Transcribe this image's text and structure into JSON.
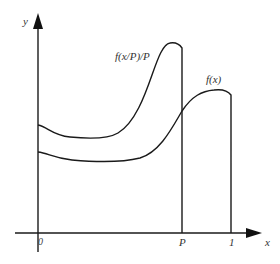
{
  "diagram": {
    "axes": {
      "y_label": "y",
      "x_label": "x",
      "origin_label": "0"
    },
    "x_ticks": [
      {
        "label": "P",
        "position": "P"
      },
      {
        "label": "1",
        "position": "1"
      }
    ],
    "curves": [
      {
        "name": "scaled-function",
        "label": "f(x/P)/P",
        "domain": "0 to P",
        "shape": "dips near start, rises steeply to a peak just before P, drops vertically to x-axis at P"
      },
      {
        "name": "original-function",
        "label": "f(x)",
        "domain": "0 to 1",
        "shape": "starts lower, shallow dip, rises to a peak near 1, drops vertically to x-axis at 1"
      }
    ],
    "colors": {
      "line": "#1a1a1a",
      "background": "#ffffff"
    }
  }
}
